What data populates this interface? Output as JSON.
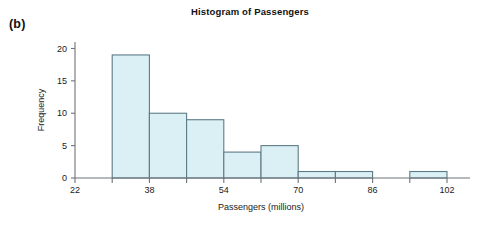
{
  "figure": {
    "panel_label": "(b)"
  },
  "chart_data": {
    "type": "bar",
    "title": "Histogram of Passengers",
    "xlabel": "Passengers (millions)",
    "ylabel": "Frequency",
    "bin_width": 8,
    "bin_edges": [
      30,
      38,
      46,
      54,
      62,
      70,
      78,
      86,
      94,
      102
    ],
    "categories": [
      "30-38",
      "38-46",
      "46-54",
      "54-62",
      "62-70",
      "70-78",
      "78-86",
      "86-94",
      "94-102"
    ],
    "values": [
      19,
      10,
      9,
      4,
      5,
      1,
      1,
      0,
      1
    ],
    "xlim": [
      22,
      102
    ],
    "ylim": [
      0,
      21
    ],
    "xticks": [
      22,
      38,
      54,
      70,
      86,
      102
    ],
    "xtick_labels": [
      "22",
      "38",
      "54",
      "70",
      "86",
      "102"
    ],
    "xminor_ticks": [
      30,
      46,
      62,
      78,
      94
    ],
    "yticks": [
      0,
      5,
      10,
      15,
      20
    ],
    "ytick_labels": [
      "0",
      "5",
      "10",
      "15",
      "20"
    ],
    "grid": false,
    "legend": false,
    "bar_fill_color": "#daf0f5",
    "bar_edge_color": "#5d7b86",
    "axis_color": "#6d7478"
  }
}
